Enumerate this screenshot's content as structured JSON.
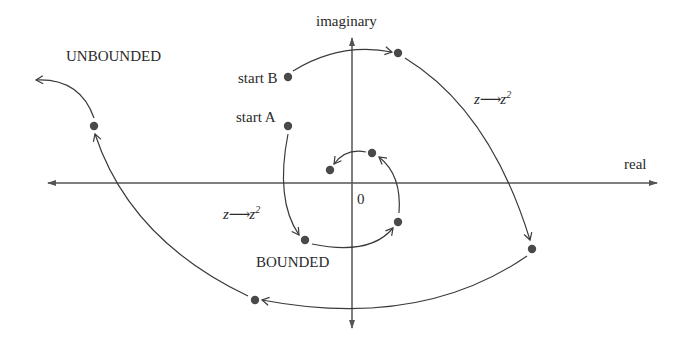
{
  "diagram": {
    "axes": {
      "horizontal_label": "real",
      "vertical_label": "imaginary",
      "origin_label": "0"
    },
    "labels": {
      "unbounded": "UNBOUNDED",
      "bounded": "BOUNDED",
      "start_a": "start A",
      "start_b": "start B"
    },
    "map_label": {
      "z": "z",
      "arrow": "⟶",
      "z2_base": "z",
      "z2_exp": "2"
    },
    "orbits": [
      {
        "name": "orbit-A",
        "outcome": "BOUNDED",
        "points": [
          [
            288,
            126
          ],
          [
            305,
            240
          ],
          [
            398,
            222
          ],
          [
            372,
            153
          ],
          [
            330,
            170
          ]
        ]
      },
      {
        "name": "orbit-B",
        "outcome": "UNBOUNDED",
        "points": [
          [
            288,
            77
          ],
          [
            398,
            53
          ],
          [
            532,
            249
          ],
          [
            255,
            300
          ],
          [
            94,
            126
          ],
          [
            36,
            79
          ]
        ]
      }
    ],
    "colors": {
      "ink": "#3a3a3a",
      "dot": "#4a4a4a"
    }
  }
}
